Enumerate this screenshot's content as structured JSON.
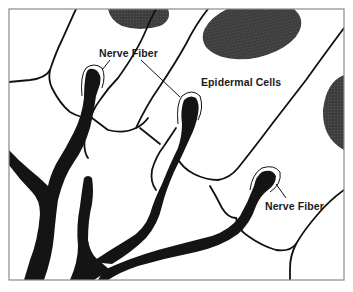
{
  "diagram": {
    "type": "anatomical-illustration",
    "labels": {
      "nerve_fiber_upper": "Nerve Fiber",
      "epidermal_cells": "Epidermal Cells",
      "nerve_fiber_lower": "Nerve Fiber"
    },
    "colors": {
      "background": "#ffffff",
      "frame": "#8a8a8a",
      "cell_outline": "#111111",
      "nerve_fiber": "#141414",
      "nucleus": "#3a3a3a",
      "label_text": "#1a1a1a"
    }
  }
}
